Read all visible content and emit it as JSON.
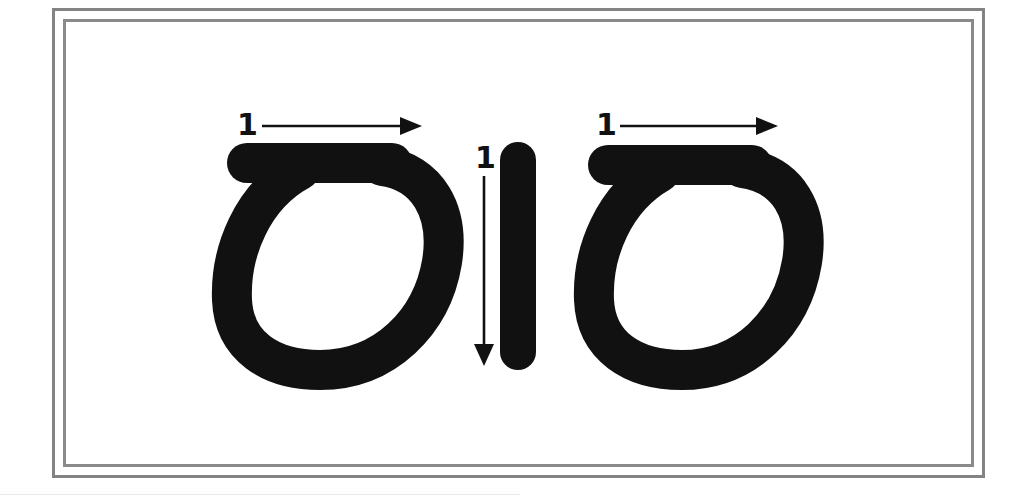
{
  "page": {
    "background_color": "#ffffff",
    "frame_color": "#838383",
    "ink_color": "#111111",
    "width": 1034,
    "height": 503
  },
  "diagram": {
    "type": "stroke-order-guide",
    "script_note": "Two loop glyphs with a vertical bar stroke between them",
    "glyphs": [
      {
        "id": "glyph-left",
        "name": "left-loop-character",
        "description": "Rounded loop with horizontal top bar extending to the left",
        "stroke_count": 1,
        "bounds": {
          "x": 227,
          "y": 143,
          "width": 218,
          "height": 225
        },
        "annotation": {
          "number": "1",
          "direction": "right",
          "arrow_from": {
            "x": 262,
            "y": 126
          },
          "arrow_to": {
            "x": 414,
            "y": 126
          }
        }
      },
      {
        "id": "glyph-middle",
        "name": "vertical-bar-stroke",
        "description": "Thick rounded vertical bar",
        "stroke_count": 1,
        "bounds": {
          "x": 500,
          "y": 142,
          "width": 36,
          "height": 228
        },
        "annotation": {
          "number": "1",
          "direction": "down",
          "arrow_from": {
            "x": 484,
            "y": 176
          },
          "arrow_to": {
            "x": 484,
            "y": 358
          }
        }
      },
      {
        "id": "glyph-right",
        "name": "right-loop-character",
        "description": "Rounded loop with horizontal top bar extending to the left",
        "stroke_count": 1,
        "bounds": {
          "x": 588,
          "y": 145,
          "width": 217,
          "height": 223
        },
        "annotation": {
          "number": "1",
          "direction": "right",
          "arrow_from": {
            "x": 620,
            "y": 126
          },
          "arrow_to": {
            "x": 770,
            "y": 126
          }
        }
      }
    ],
    "labels": {
      "left_stroke_number": "1",
      "middle_stroke_number": "1",
      "right_stroke_number": "1"
    }
  }
}
